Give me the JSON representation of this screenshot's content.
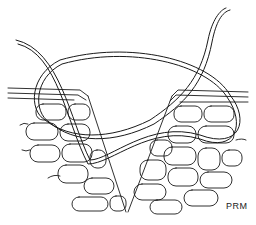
{
  "figure": {
    "signature": "PRM",
    "colors": {
      "line": "#1a1a1a",
      "background": "#ffffff"
    }
  }
}
